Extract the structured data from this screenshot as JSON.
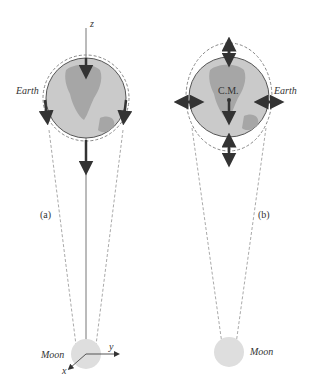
{
  "panels": [
    {
      "id": "a",
      "label": "(a)",
      "earth_label": "Earth",
      "moon_label": "Moon",
      "axes": {
        "z": "z",
        "y": "y",
        "x": "x"
      }
    },
    {
      "id": "b",
      "label": "(b)",
      "earth_label": "Earth",
      "moon_label": "Moon",
      "center_label": "C.M."
    }
  ],
  "colors": {
    "earth_fill": "#c8c8c8",
    "land": "#a8a8a8",
    "outline": "#555555",
    "arrow": "#333333",
    "dashed": "#999999",
    "moon_fill": "#dcdcdc"
  }
}
